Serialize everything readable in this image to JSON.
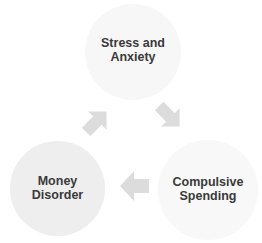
{
  "diagram": {
    "type": "cycle",
    "nodes": [
      {
        "id": "top",
        "line1": "Stress and",
        "line2": "Anxiety"
      },
      {
        "id": "right",
        "line1": "Compulsive",
        "line2": "Spending"
      },
      {
        "id": "left",
        "line1": "Money",
        "line2": "Disorder"
      }
    ],
    "edges": [
      {
        "from": "top",
        "to": "right",
        "icon": "arrow-down-right"
      },
      {
        "from": "right",
        "to": "left",
        "icon": "arrow-left"
      },
      {
        "from": "left",
        "to": "top",
        "icon": "arrow-up-right"
      }
    ],
    "colors": {
      "node_light": "#f7f7f7",
      "node_mid": "#eeeeee",
      "arrow": "#dcdcdc",
      "text": "#3a3a3a"
    }
  }
}
